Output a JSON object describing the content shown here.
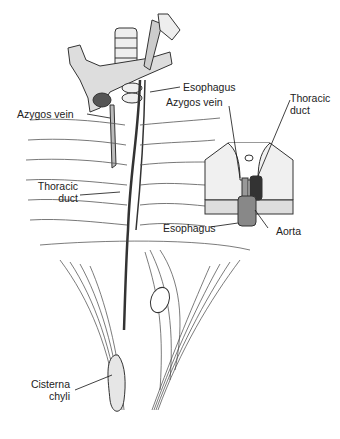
{
  "figure": {
    "labels": {
      "esophagus_main": "Esophagus",
      "azygos_main": "Azygos vein",
      "thoracic_duct_main_1": "Thoracic",
      "thoracic_duct_main_2": "duct",
      "cisterna_1": "Cisterna",
      "cisterna_2": "chyli",
      "inset_azygos": "Azygos vein",
      "inset_thoracic_1": "Thoracic",
      "inset_thoracic_2": "duct",
      "inset_esophagus": "Esophagus",
      "inset_aorta": "Aorta"
    }
  }
}
